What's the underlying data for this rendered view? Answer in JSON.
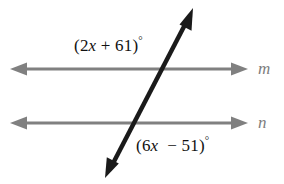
{
  "figure": {
    "type": "geometry-diagram",
    "background_color": "#ffffff",
    "width": 284,
    "height": 184
  },
  "colors": {
    "parallel_line": "#808080",
    "transversal": "#1a1a1a",
    "label_text": "#111111",
    "line_name_text": "#7d7d7d"
  },
  "lines": {
    "parallel_m": {
      "name": "m",
      "y": 69,
      "x_start": 10,
      "x_end": 248,
      "arrow_left": true,
      "arrow_right": true
    },
    "parallel_n": {
      "name": "n",
      "y": 123,
      "x_start": 10,
      "x_end": 248,
      "arrow_left": true,
      "arrow_right": true
    },
    "transversal": {
      "x_top": 193,
      "y_top": 8,
      "x_bottom": 105,
      "y_bottom": 178,
      "arrow_top": true,
      "arrow_bottom": true
    }
  },
  "intersections": {
    "with_m": {
      "x": 163,
      "y": 69
    },
    "with_n": {
      "x": 133,
      "y": 123
    }
  },
  "labels": {
    "angle_top": {
      "open_paren": "(",
      "coefficient": "2",
      "variable": "x",
      "operator": "+",
      "constant": "61",
      "close_paren": ")",
      "degree": "°",
      "full_text": "(2x + 61)°"
    },
    "angle_bottom": {
      "open_paren": "(",
      "coefficient": "6",
      "variable": "x",
      "operator": "−",
      "constant": "51",
      "close_paren": ")",
      "degree": "°",
      "full_text": "(6x − 51)°"
    },
    "line_m": "m",
    "line_n": "n"
  }
}
